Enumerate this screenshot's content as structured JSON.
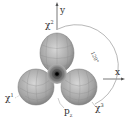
{
  "diagram": {
    "axes": {
      "x": "x",
      "y": "y"
    },
    "labels": {
      "top": {
        "base": "χ",
        "sup": "2"
      },
      "right": {
        "base": "χ",
        "sup": "3"
      },
      "left": {
        "base": "χ",
        "sup": "1"
      },
      "bottom": {
        "base": "p",
        "sub": "z"
      },
      "angle": "120°"
    },
    "colors": {
      "lobe": "#a8a8a8",
      "lobe_dark": "#6e6e6e",
      "grid": "#8a8a8a",
      "axis": "#555555",
      "arc": "#999999",
      "core": "#1a1a1a"
    }
  }
}
